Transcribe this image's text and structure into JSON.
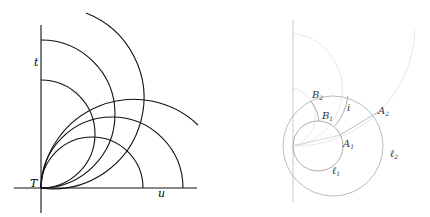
{
  "left_figure": {
    "labels": {
      "t": "t",
      "u": "u",
      "T": "T"
    },
    "stroke_color": "#111111"
  },
  "right_figure": {
    "labels": {
      "B2": "B",
      "B2_sub": "2",
      "B1": "B",
      "B1_sub": "1",
      "i": "i",
      "A2": "A",
      "A2_sub": "2",
      "A1": "A",
      "A1_sub": "1",
      "l1": "ℓ",
      "l1_sub": "1",
      "l2": "ℓ",
      "l2_sub": "2"
    },
    "stroke_color": "#999999",
    "faint_color": "#dddddd"
  }
}
